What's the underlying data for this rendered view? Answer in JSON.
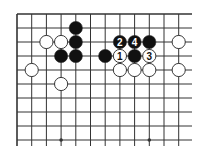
{
  "diagram": {
    "type": "go-board-diagram",
    "grid": {
      "columns": 12,
      "rows": 10,
      "origin_x": 17,
      "origin_y": 14,
      "spacing_x": 14.7,
      "spacing_y": 14.0,
      "extend_right_to": 192,
      "extend_down_to": 146,
      "edges": {
        "top": true,
        "left": true,
        "right": false,
        "bottom": false
      },
      "line_color": "#333333",
      "background": "#ffffff"
    },
    "star_points": [
      {
        "col": 3,
        "row": 9
      },
      {
        "col": 9,
        "row": 9
      }
    ],
    "stones": [
      {
        "color": "black",
        "col": 4,
        "row": 1,
        "label": ""
      },
      {
        "color": "black",
        "col": 4,
        "row": 2,
        "label": ""
      },
      {
        "color": "black",
        "col": 4,
        "row": 3,
        "label": ""
      },
      {
        "color": "black",
        "col": 3,
        "row": 3,
        "label": ""
      },
      {
        "color": "black",
        "col": 6,
        "row": 3,
        "label": ""
      },
      {
        "color": "black",
        "col": 7,
        "row": 2,
        "label": "2"
      },
      {
        "color": "black",
        "col": 8,
        "row": 2,
        "label": "4"
      },
      {
        "color": "black",
        "col": 9,
        "row": 2,
        "label": ""
      },
      {
        "color": "black",
        "col": 8,
        "row": 3,
        "label": ""
      },
      {
        "color": "white",
        "col": 2,
        "row": 2,
        "label": ""
      },
      {
        "color": "white",
        "col": 3,
        "row": 2,
        "label": ""
      },
      {
        "color": "white",
        "col": 1,
        "row": 4,
        "label": ""
      },
      {
        "color": "white",
        "col": 3,
        "row": 5,
        "label": ""
      },
      {
        "color": "white",
        "col": 11,
        "row": 2,
        "label": ""
      },
      {
        "color": "white",
        "col": 11,
        "row": 4,
        "label": ""
      },
      {
        "color": "white",
        "col": 7,
        "row": 3,
        "label": "1"
      },
      {
        "color": "white",
        "col": 9,
        "row": 3,
        "label": "3"
      },
      {
        "color": "white",
        "col": 7,
        "row": 4,
        "label": ""
      },
      {
        "color": "white",
        "col": 8,
        "row": 4,
        "label": ""
      },
      {
        "color": "white",
        "col": 9,
        "row": 4,
        "label": ""
      }
    ],
    "colors": {
      "black_stone": "#111111",
      "white_stone": "#ffffff",
      "stone_outline": "#222222",
      "label_on_black": "#ffffff",
      "label_on_white": "#111111"
    }
  }
}
